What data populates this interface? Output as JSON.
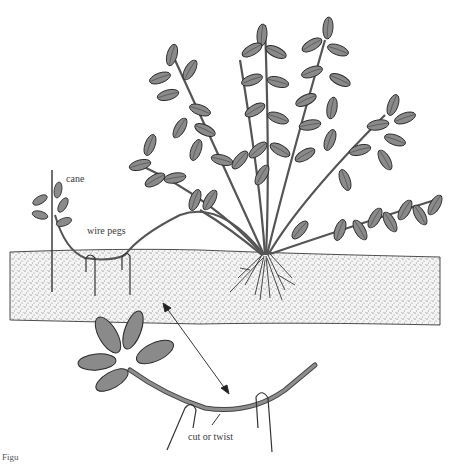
{
  "figure": {
    "caption_fragment": "Figu",
    "labels": {
      "cane": "cane",
      "wire_pegs": "wire pegs",
      "cut_or_twist": "cut or twist"
    },
    "colors": {
      "leaf_fill": "#8a8a8a",
      "leaf_stroke": "#2a2a2a",
      "stem": "#6f6f6f",
      "soil_speckle": "#4a4a4a",
      "background": "#ffffff"
    },
    "elements": {
      "parent_plant": "Bushy plant with many leafy shoots rooted in soil at center-right",
      "layered_stem": "Long stem bent along soil surface, pegged down with wire pegs",
      "new_plant": "Young plant tip tied to a vertical cane at far left",
      "detail_inset": "Enlarged view of stem pegged with two wire pegs showing cut or twist point",
      "arrow": "Double-headed arrow linking soil section to detail inset"
    }
  }
}
